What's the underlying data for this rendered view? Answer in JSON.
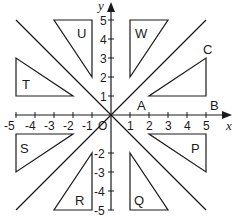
{
  "diagram": {
    "type": "coordinate-grid-transformations",
    "axes": {
      "x_label": "x",
      "y_label": "y",
      "origin_label": "O",
      "x_ticks": [
        "-5",
        "-4",
        "-3",
        "-2",
        "-1",
        "1",
        "2",
        "3",
        "4",
        "5"
      ],
      "y_ticks_positive": [
        "1",
        "2",
        "3",
        "4",
        "5"
      ],
      "y_ticks_negative": [
        "-2",
        "-3",
        "-4",
        "-5"
      ],
      "range": [
        -5,
        5
      ]
    },
    "lines": [
      {
        "name": "line-y-equals-x",
        "from": [
          -5,
          -5
        ],
        "to": [
          5,
          5
        ]
      },
      {
        "name": "line-y-equals-neg-x",
        "from": [
          -5,
          5
        ],
        "to": [
          5,
          -5
        ]
      }
    ],
    "shapes": [
      {
        "name": "triangle-ABC",
        "label": "",
        "vertices": [
          [
            2,
            1
          ],
          [
            5,
            1
          ],
          [
            5,
            3
          ]
        ],
        "vertex_labels": [
          "A",
          "B",
          "C"
        ]
      },
      {
        "name": "triangle-W",
        "label": "W",
        "vertices": [
          [
            1,
            5
          ],
          [
            3,
            5
          ],
          [
            1,
            2
          ]
        ]
      },
      {
        "name": "triangle-U",
        "label": "U",
        "vertices": [
          [
            -3,
            5
          ],
          [
            -1,
            5
          ],
          [
            -1,
            2
          ]
        ]
      },
      {
        "name": "triangle-T",
        "label": "T",
        "vertices": [
          [
            -5,
            3
          ],
          [
            -5,
            1
          ],
          [
            -2,
            1
          ]
        ]
      },
      {
        "name": "triangle-S",
        "label": "S",
        "vertices": [
          [
            -5,
            -1
          ],
          [
            -2,
            -1
          ],
          [
            -5,
            -3
          ]
        ]
      },
      {
        "name": "triangle-R",
        "label": "R",
        "vertices": [
          [
            -1,
            -2
          ],
          [
            -1,
            -5
          ],
          [
            -3,
            -5
          ]
        ]
      },
      {
        "name": "triangle-Q",
        "label": "Q",
        "vertices": [
          [
            1,
            -2
          ],
          [
            1,
            -5
          ],
          [
            3,
            -5
          ]
        ]
      },
      {
        "name": "triangle-P",
        "label": "P",
        "vertices": [
          [
            2,
            -1
          ],
          [
            5,
            -1
          ],
          [
            5,
            -3
          ]
        ]
      }
    ],
    "labels": {
      "A": "A",
      "B": "B",
      "C": "C",
      "W": "W",
      "U": "U",
      "T": "T",
      "S": "S",
      "R": "R",
      "Q": "Q",
      "P": "P"
    },
    "colors": {
      "stroke": "#1a1a1a",
      "background": "#ffffff"
    }
  }
}
